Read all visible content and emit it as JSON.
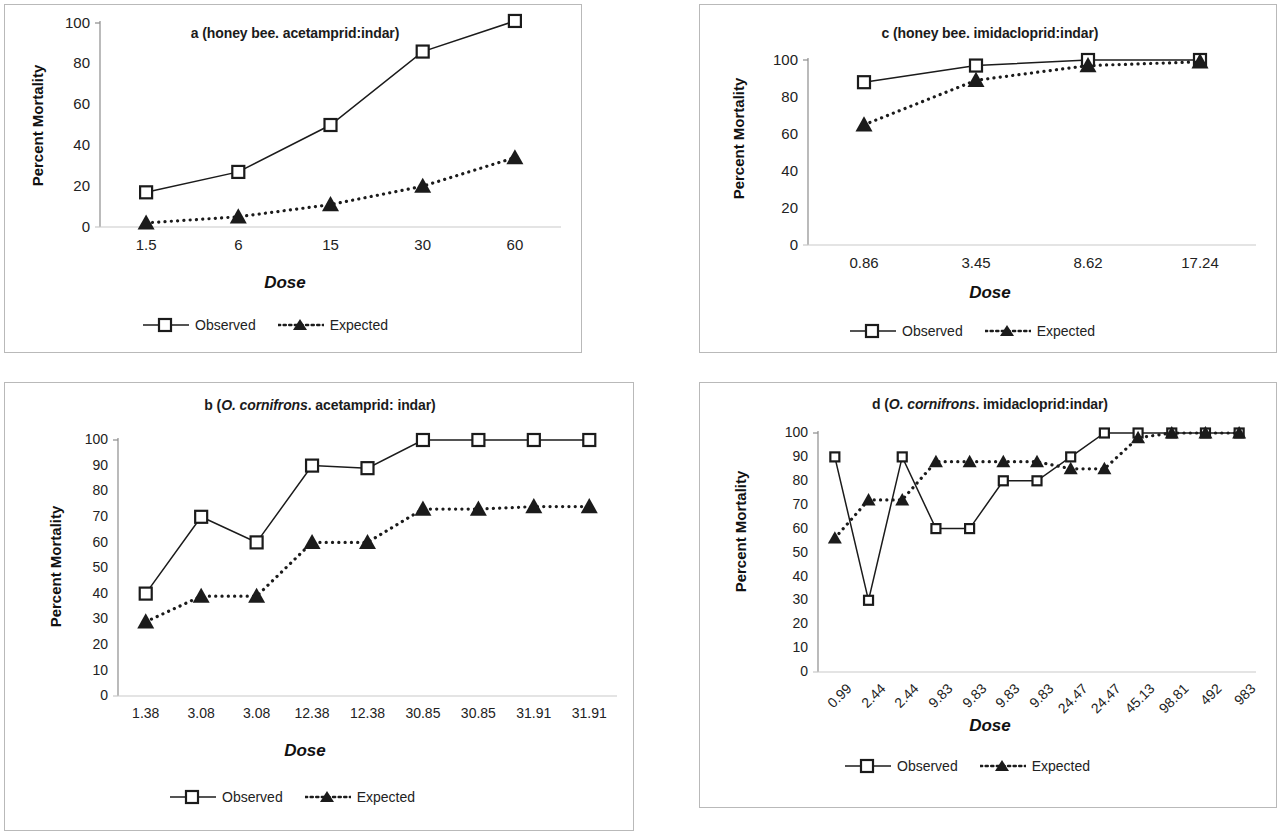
{
  "figure": {
    "background": "#ffffff",
    "line_color": "#1b1b1b",
    "panel_border_color": "#b9b9b9"
  },
  "legend": {
    "observed_label": "Observed",
    "expected_label": "Expected"
  },
  "axis": {
    "ylabel": "Percent Mortality",
    "xlabel": "Dose"
  },
  "panels": [
    {
      "id": "a",
      "title_prefix": "a (honey bee",
      "title_species": "",
      "title_suffix": ". acetamprid:indar)",
      "title_plain": "a (honey bee. acetamprid:indar)"
    },
    {
      "id": "b",
      "title_prefix": "b (",
      "title_species": "O. cornifrons",
      "title_suffix": ". acetamprid: indar)",
      "title_plain": "b (O. cornifrons. acetamprid: indar)"
    },
    {
      "id": "c",
      "title_prefix": "c (honey bee",
      "title_species": "",
      "title_suffix": ". imidacloprid:indar)",
      "title_plain": "c (honey bee. imidacloprid:indar)"
    },
    {
      "id": "d",
      "title_prefix": "d (",
      "title_species": "O. cornifrons",
      "title_suffix": ". imidacloprid:indar)",
      "title_plain": "d (O. cornifrons. imidacloprid:indar)"
    }
  ],
  "chart_data": [
    {
      "panel": "a",
      "type": "line",
      "title": "a (honey bee. acetamprid:indar)",
      "xlabel": "Dose",
      "ylabel": "Percent Mortality",
      "categories": [
        "1.5",
        "6",
        "15",
        "30",
        "60"
      ],
      "yticks": [
        0,
        20,
        40,
        60,
        80,
        100
      ],
      "ylim": [
        0,
        100
      ],
      "grid": false,
      "legend_position": "bottom",
      "series": [
        {
          "name": "Observed",
          "marker": "open-square",
          "line": "solid",
          "values": [
            17,
            27,
            50,
            86,
            101
          ]
        },
        {
          "name": "Expected",
          "marker": "filled-triangle",
          "line": "dotted",
          "values": [
            2,
            5,
            11,
            20,
            34
          ]
        }
      ]
    },
    {
      "panel": "b",
      "type": "line",
      "title": "b (O. cornifrons. acetamprid: indar)",
      "xlabel": "Dose",
      "ylabel": "Percent Mortality",
      "categories": [
        "1.38",
        "3.08",
        "3.08",
        "12.38",
        "12.38",
        "30.85",
        "30.85",
        "31.91",
        "31.91"
      ],
      "yticks": [
        0,
        10,
        20,
        30,
        40,
        50,
        60,
        70,
        80,
        90,
        100
      ],
      "ylim": [
        0,
        100
      ],
      "grid": false,
      "legend_position": "bottom",
      "series": [
        {
          "name": "Observed",
          "marker": "open-square",
          "line": "solid",
          "values": [
            40,
            70,
            60,
            90,
            89,
            100,
            100,
            100,
            100
          ]
        },
        {
          "name": "Expected",
          "marker": "filled-triangle",
          "line": "dotted",
          "values": [
            29,
            39,
            39,
            60,
            60,
            73,
            73,
            74,
            74
          ]
        }
      ]
    },
    {
      "panel": "c",
      "type": "line",
      "title": "c (honey bee. imidacloprid:indar)",
      "xlabel": "Dose",
      "ylabel": "Percent Mortality",
      "categories": [
        "0.86",
        "3.45",
        "8.62",
        "17.24"
      ],
      "yticks": [
        0,
        20,
        40,
        60,
        80,
        100
      ],
      "ylim": [
        0,
        100
      ],
      "grid": false,
      "legend_position": "bottom",
      "series": [
        {
          "name": "Observed",
          "marker": "open-square",
          "line": "solid",
          "values": [
            88,
            97,
            100,
            100
          ]
        },
        {
          "name": "Expected",
          "marker": "filled-triangle",
          "line": "dotted",
          "values": [
            65,
            89,
            97,
            99
          ]
        }
      ]
    },
    {
      "panel": "d",
      "type": "line",
      "title": "d (O. cornifrons. imidacloprid:indar)",
      "xlabel": "Dose",
      "ylabel": "Percent Mortality",
      "categories": [
        "0.99",
        "2.44",
        "2.44",
        "9.83",
        "9.83",
        "9.83",
        "9.83",
        "24.47",
        "24.47",
        "45.13",
        "98.81",
        "492",
        "983"
      ],
      "yticks": [
        0,
        10,
        20,
        30,
        40,
        50,
        60,
        70,
        80,
        90,
        100
      ],
      "ylim": [
        0,
        100
      ],
      "grid": false,
      "legend_position": "bottom",
      "series": [
        {
          "name": "Observed",
          "marker": "open-square",
          "line": "solid",
          "values": [
            90,
            30,
            90,
            60,
            60,
            80,
            80,
            90,
            100,
            100,
            100,
            100,
            100
          ]
        },
        {
          "name": "Expected",
          "marker": "filled-triangle",
          "line": "dotted",
          "values": [
            56,
            72,
            72,
            88,
            88,
            88,
            88,
            85,
            85,
            98,
            100,
            100,
            100
          ]
        }
      ]
    }
  ]
}
